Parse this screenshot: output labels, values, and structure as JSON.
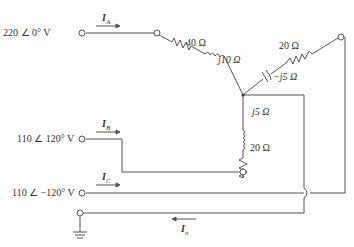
{
  "sources": {
    "a": {
      "label": "220 ∠ 0° V",
      "current": "I",
      "sub": "A"
    },
    "b": {
      "label": "110 ∠ 120° V",
      "current": "I",
      "sub": "B"
    },
    "c": {
      "label": "110 ∠ −120° V",
      "current": "I",
      "sub": "C"
    },
    "n": {
      "current": "I",
      "sub": "n"
    }
  },
  "components": {
    "r_a": "40 Ω",
    "l_a": "j10 Ω",
    "r_c": "20 Ω",
    "c_c": "−j5 Ω",
    "l_b": "j5 Ω",
    "r_b": "20 Ω"
  },
  "colors": {
    "wire": "#555555",
    "text": "#333333"
  }
}
